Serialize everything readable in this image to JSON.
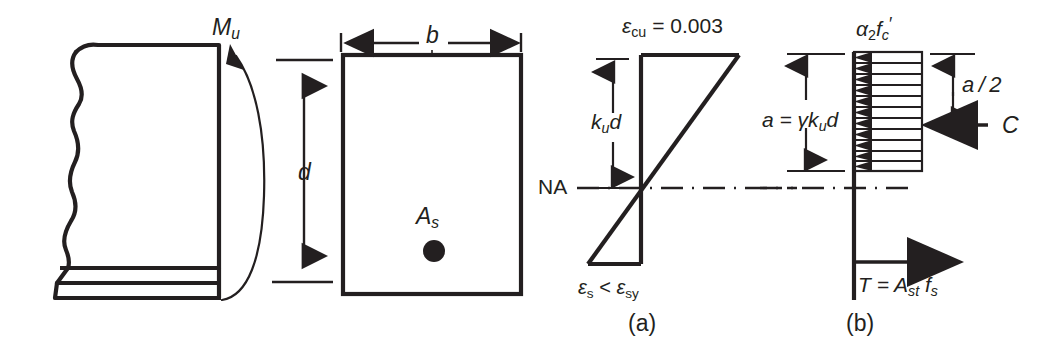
{
  "figure": {
    "ink_color": "#231f20",
    "background": "#ffffff"
  },
  "elevation": {
    "moment_label": "M",
    "moment_sub": "u",
    "depth_label": "d",
    "name": "beam-elevation-with-moment"
  },
  "cross_section": {
    "width_label": "b",
    "steel_area_label": "A",
    "steel_area_sub": "s",
    "name": "beam-cross-section"
  },
  "strain_diagram": {
    "caption": "(a)",
    "top_strain_label": "ε",
    "top_strain_sub": "cu",
    "top_strain_value": "= 0.003",
    "neutral_axis_label": "NA",
    "depth_label": "k",
    "depth_sub": "u",
    "depth_label2": "d",
    "bottom_strain_a": "ε",
    "bottom_strain_a_sub": "s",
    "bottom_strain_rel": "<",
    "bottom_strain_b": "ε",
    "bottom_strain_b_sub": "sy"
  },
  "stress_diagram": {
    "caption": "(b)",
    "concrete_stress_alpha": "α",
    "concrete_stress_alpha_sub": "2",
    "concrete_stress_f": "f",
    "concrete_stress_f_sub": "c",
    "concrete_stress_prime": "′",
    "block_depth_eq": "a = γk",
    "block_depth_sub": "u",
    "block_depth_tail": "d",
    "lever_label": "a / 2",
    "compression_label": "C",
    "tension_label": "T = A",
    "tension_sub": "st",
    "tension_f": "f",
    "tension_f_sub": "s"
  }
}
